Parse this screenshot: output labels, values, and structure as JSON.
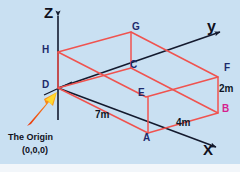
{
  "figure": {
    "background_color": "#c9e0f2",
    "axis_color": "#141a2e",
    "solid_color": "#f0534f",
    "vertex_label_color": "#1d2a6b",
    "vertex_label_accent_color": "#d51f8e",
    "arrow_color": "#f04a18",
    "arrow_tip_color": "#ffe033"
  },
  "axes": [
    {
      "name": "z-axis",
      "label": "Z"
    },
    {
      "name": "y-axis",
      "label": "y"
    },
    {
      "name": "x-axis",
      "label": "X"
    }
  ],
  "vertices": [
    {
      "id": "G",
      "label": "G",
      "color": "dark"
    },
    {
      "id": "H",
      "label": "H",
      "color": "dark"
    },
    {
      "id": "C",
      "label": "C",
      "color": "dark"
    },
    {
      "id": "F",
      "label": "F",
      "color": "dark"
    },
    {
      "id": "D",
      "label": "D",
      "color": "dark"
    },
    {
      "id": "E",
      "label": "E",
      "color": "dark"
    },
    {
      "id": "B",
      "label": "B",
      "color": "accent"
    },
    {
      "id": "A",
      "label": "A",
      "color": "dark"
    }
  ],
  "dimensions": [
    {
      "name": "depth",
      "label": "7m"
    },
    {
      "name": "width",
      "label": "4m"
    },
    {
      "name": "height",
      "label": "2m"
    }
  ],
  "origin": {
    "title": "The Origin",
    "coords": "(0,0,0)"
  }
}
